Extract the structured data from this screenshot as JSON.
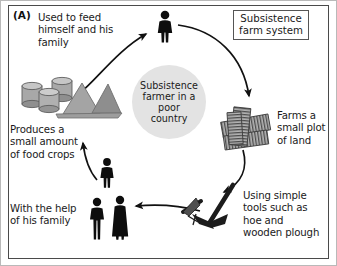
{
  "figure": {
    "panel_letter": "(A)",
    "title_box": "Subsistence\nfarm system",
    "center": "Subsistence\nfarmer in a\npoor\ncountry"
  },
  "labels": {
    "feed": "Used to feed\nhimself and his\nfamily",
    "produces": "Produces a\nsmall amount\nof food crops",
    "family_help": "With the help\nof his family",
    "farms": "Farms a\nsmall plot\nof land",
    "tools": "Using simple\ntools such as\nhoe and\nwooden plough"
  },
  "icons": {
    "farmer": "farmer-figure-icon",
    "grain": "grain-barrels-and-piles-icon",
    "family": "family-figures-icon",
    "plots": "farm-plots-icon",
    "tools": "hoe-and-plough-icon"
  },
  "colors": {
    "border": "#4a4a4a",
    "circle_fill": "#e3e3e3",
    "arrow": "#111111",
    "grain_fill": "#9a9a9a",
    "figure_fill": "#0d0d0d"
  },
  "flow": {
    "steps": [
      "Used to feed himself and his family",
      "Farms a small plot of land",
      "Using simple tools such as hoe and wooden plough",
      "With the help of his family",
      "Produces a small amount of food crops"
    ]
  }
}
